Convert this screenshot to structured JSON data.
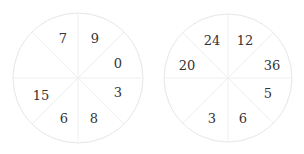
{
  "puzzle": {
    "circles": [
      {
        "id": "left",
        "cx": 78,
        "cy": 78,
        "r": 65,
        "sectors": [
          {
            "position": "top-right",
            "value": "9",
            "x": 95,
            "y": 38
          },
          {
            "position": "right-top",
            "value": "0",
            "x": 118,
            "y": 63
          },
          {
            "position": "right-bottom",
            "value": "3",
            "x": 118,
            "y": 92
          },
          {
            "position": "bottom-right",
            "value": "8",
            "x": 94,
            "y": 118
          },
          {
            "position": "bottom-left",
            "value": "6",
            "x": 64,
            "y": 118
          },
          {
            "position": "left-bottom",
            "value": "15",
            "x": 41,
            "y": 95
          },
          {
            "position": "left-top",
            "value": "",
            "x": 40,
            "y": 62
          },
          {
            "position": "top-left",
            "value": "7",
            "x": 63,
            "y": 38
          }
        ]
      },
      {
        "id": "right",
        "cx": 228,
        "cy": 78,
        "r": 64,
        "sectors": [
          {
            "position": "top-right",
            "value": "12",
            "x": 245,
            "y": 40
          },
          {
            "position": "right-top",
            "value": "36",
            "x": 272,
            "y": 65
          },
          {
            "position": "right-bottom",
            "value": "5",
            "x": 268,
            "y": 93
          },
          {
            "position": "bottom-right",
            "value": "6",
            "x": 243,
            "y": 118
          },
          {
            "position": "bottom-left",
            "value": "3",
            "x": 212,
            "y": 118
          },
          {
            "position": "left-bottom",
            "value": "",
            "x": 188,
            "y": 93
          },
          {
            "position": "left-top",
            "value": "20",
            "x": 187,
            "y": 65
          },
          {
            "position": "top-left",
            "value": "24",
            "x": 212,
            "y": 40
          }
        ]
      }
    ],
    "colors": {
      "circle_stroke": "#e6e6e6",
      "divider_stroke": "#efefef",
      "text": "#333333",
      "background": "#ffffff"
    }
  }
}
